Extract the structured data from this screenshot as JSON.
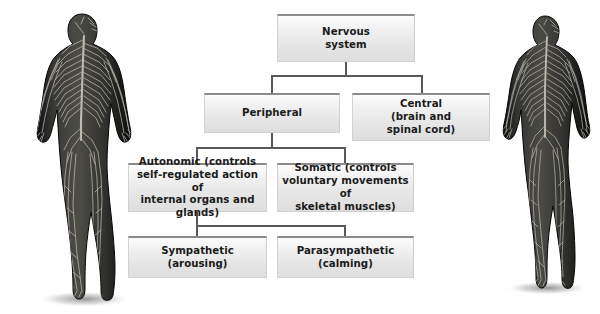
{
  "diagram": {
    "type": "hierarchy",
    "palette": {
      "box_fill_top": "#fcfcfc",
      "box_fill_bottom": "#dedede",
      "box_top_border": "#8b8b8b",
      "connector": "#595959",
      "text": "#1b1b1b",
      "figure_dark": "#2b2b2b",
      "figure_nerve": "#d8d4cc",
      "page_background": "#ffffff"
    },
    "nodes": [
      {
        "id": "nervous-system",
        "label": "Nervous\nsystem",
        "level": 0
      },
      {
        "id": "peripheral",
        "label": "Peripheral",
        "level": 1
      },
      {
        "id": "central",
        "label": "Central\n(brain and\nspinal cord)",
        "level": 1
      },
      {
        "id": "autonomic",
        "label": "Autonomic (controls\nself-regulated action of\ninternal organs and glands)",
        "level": 2
      },
      {
        "id": "somatic",
        "label": "Somatic (controls\nvoluntary movements of\nskeletal muscles)",
        "level": 2
      },
      {
        "id": "sympathetic",
        "label": "Sympathetic\n(arousing)",
        "level": 3
      },
      {
        "id": "parasympathetic",
        "label": "Parasympathetic\n(calming)",
        "level": 3
      }
    ],
    "edges": [
      {
        "from": "nervous-system",
        "to": "peripheral"
      },
      {
        "from": "nervous-system",
        "to": "central"
      },
      {
        "from": "peripheral",
        "to": "autonomic"
      },
      {
        "from": "peripheral",
        "to": "somatic"
      },
      {
        "from": "autonomic",
        "to": "sympathetic"
      },
      {
        "from": "autonomic",
        "to": "parasympathetic"
      }
    ],
    "figures": [
      {
        "id": "figure-left",
        "description": "human-nervous-system-illustration"
      },
      {
        "id": "figure-right",
        "description": "human-nervous-system-illustration"
      }
    ]
  }
}
